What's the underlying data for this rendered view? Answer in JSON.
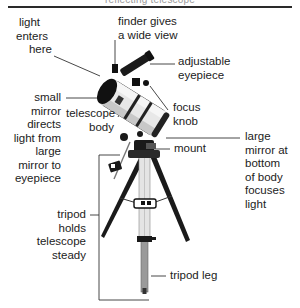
{
  "header": {
    "title": "reflecting telescope"
  },
  "labels": {
    "light_enters": [
      "light",
      "enters",
      "here"
    ],
    "finder": [
      "finder gives",
      "a wide view"
    ],
    "eyepiece": [
      "adjustable",
      "eyepiece"
    ],
    "small_mirror": [
      "small",
      "mirror",
      "directs",
      "light from",
      "large",
      "mirror to",
      "eyepiece"
    ],
    "telescope_body": [
      "telescope",
      "body"
    ],
    "focus_knob": [
      "focus",
      "knob"
    ],
    "mount": [
      "mount"
    ],
    "large_mirror": [
      "large",
      "mirror at",
      "bottom",
      "of body",
      "focuses",
      "light"
    ],
    "tripod": [
      "tripod",
      "holds",
      "telescope",
      "steady"
    ],
    "tripod_leg": [
      "tripod leg"
    ]
  },
  "colors": {
    "ink": "#1f1f1f",
    "tube": "#e6e6e6",
    "header_text": "#9a9a9a"
  }
}
